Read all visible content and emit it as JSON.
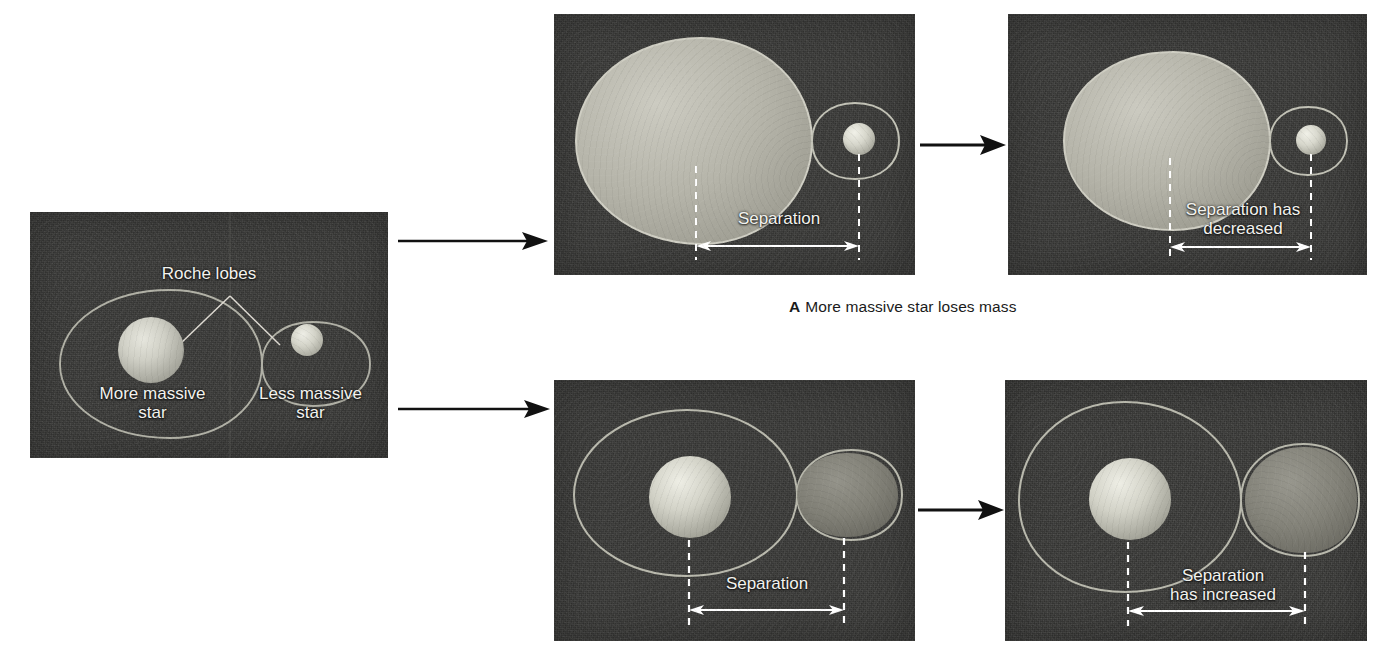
{
  "figure": {
    "background_color": "#ffffff",
    "panel_background_color": "#3b3b39",
    "star_color": "#c9c9c0",
    "lobe_fill_color": "#a8a89c",
    "outline_color": "#b9b9ae",
    "text_color": "#f2f2ee",
    "caption_color": "#1b1b1b"
  },
  "panels": {
    "initial": {
      "name": "Initial binary system with Roche lobes",
      "labels": {
        "roche_lobes": "Roche lobes",
        "more_massive": "More massive\nstar",
        "less_massive": "Less massive\nstar"
      }
    },
    "a_before": {
      "name": "Sequence A before mass transfer",
      "labels": {
        "separation": "Separation"
      }
    },
    "a_after": {
      "name": "Sequence A after mass transfer",
      "labels": {
        "separation": "Separation has\ndecreased"
      }
    },
    "b_before": {
      "name": "Sequence B before mass transfer",
      "labels": {
        "separation": "Separation"
      }
    },
    "b_after": {
      "name": "Sequence B after mass transfer",
      "labels": {
        "separation": "Separation\nhas increased"
      }
    }
  },
  "captions": {
    "a": {
      "tag": "A",
      "text": "More massive star loses mass"
    }
  },
  "arrows": {
    "initial_to_a": "arrow-right-icon",
    "initial_to_b": "arrow-right-icon",
    "a_before_to_after": "arrow-right-icon",
    "b_before_to_after": "arrow-right-icon"
  }
}
